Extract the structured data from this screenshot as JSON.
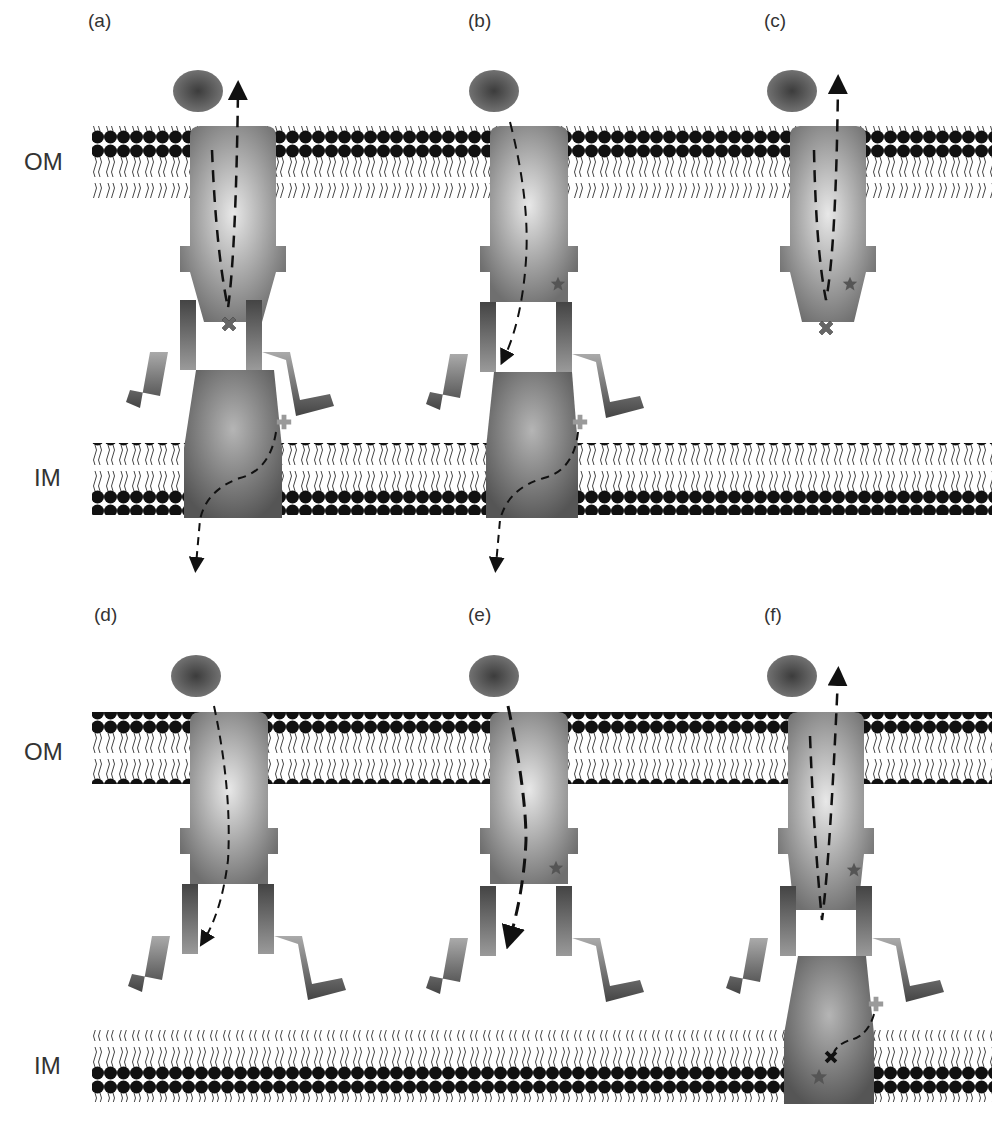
{
  "figure": {
    "membranes": {
      "outer": "OM",
      "inner": "IM"
    },
    "panels": [
      {
        "id": "a",
        "label": "(a)"
      },
      {
        "id": "b",
        "label": "(b)"
      },
      {
        "id": "c",
        "label": "(c)"
      },
      {
        "id": "d",
        "label": "(d)"
      },
      {
        "id": "e",
        "label": "(e)"
      },
      {
        "id": "f",
        "label": "(f)"
      }
    ],
    "rows": [
      {
        "om_label": "OM",
        "im_label": "IM"
      },
      {
        "om_label": "OM",
        "im_label": "IM"
      }
    ],
    "colors": {
      "lipid_head": "#111111",
      "protein_gray": "#8a8a8a",
      "ball": "#5e5e5e",
      "marker": "#555555",
      "plus": "#999999"
    }
  }
}
